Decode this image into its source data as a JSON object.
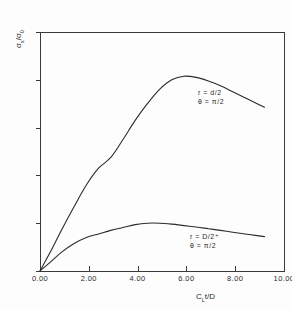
{
  "chart_data": {
    "type": "line",
    "title": "",
    "xlabel": "C_L t/D",
    "ylabel": "sigma_x / sigma_0",
    "xlim": [
      0.0,
      10.0
    ],
    "ylim": [
      0.0,
      10.0
    ],
    "grid": false,
    "legend_position": "inline-annotation",
    "x_ticks": [
      "0.00",
      "2.00",
      "4.00",
      "6.00",
      "8.00",
      "10.00"
    ],
    "y_ticks": [
      "0.00",
      "2.00",
      "4.00",
      "6.00",
      "8.00",
      "10.00"
    ],
    "x_tick_values": [
      0,
      2,
      4,
      6,
      8,
      10
    ],
    "y_tick_values": [
      0,
      2,
      4,
      6,
      8,
      10
    ],
    "series": [
      {
        "name": "r = d/2, theta = pi/2",
        "annotation_line1": "r = d/2",
        "annotation_line2": "θ = π/2",
        "x": [
          0.0,
          0.4,
          0.9,
          1.4,
          1.9,
          2.4,
          2.9,
          3.4,
          3.9,
          4.4,
          4.9,
          5.4,
          5.9,
          6.4,
          6.9,
          7.4,
          7.9,
          8.4,
          8.9,
          9.2
        ],
        "values": [
          0.0,
          0.75,
          1.75,
          2.7,
          3.6,
          4.3,
          4.75,
          5.5,
          6.3,
          7.0,
          7.6,
          8.0,
          8.15,
          8.1,
          7.95,
          7.75,
          7.5,
          7.25,
          7.0,
          6.85
        ]
      },
      {
        "name": "r = D/2+, theta = pi/2",
        "annotation_line1": "r = D/2⁺",
        "annotation_line2": "θ = π/2",
        "x": [
          0.0,
          0.4,
          0.9,
          1.4,
          1.9,
          2.4,
          2.9,
          3.4,
          3.9,
          4.4,
          4.9,
          5.4,
          5.9,
          6.4,
          6.9,
          7.4,
          7.9,
          8.4,
          8.9,
          9.2
        ],
        "values": [
          0.0,
          0.35,
          0.8,
          1.15,
          1.4,
          1.55,
          1.7,
          1.82,
          1.94,
          2.0,
          2.0,
          1.96,
          1.9,
          1.84,
          1.77,
          1.7,
          1.62,
          1.55,
          1.48,
          1.44
        ]
      }
    ],
    "colors": {
      "axis": "#3a3a3a",
      "curve": "#2b2b2b",
      "background": "#fdfdfd"
    }
  },
  "axis_titles": {
    "y": "σₓ/σ₀",
    "x": "Cₗt/D"
  }
}
